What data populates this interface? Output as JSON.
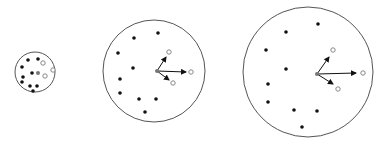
{
  "diagram": {
    "colors": {
      "background": "#ffffff",
      "circle_stroke": "#555555",
      "filled_point": "#111111",
      "center_point": "#777777",
      "hollow_point": "#888888",
      "arrow": "#111111"
    },
    "panels": [
      {
        "id": "small",
        "circle": {
          "cx": 35,
          "cy": 72,
          "r": 20
        },
        "filled_points": [
          [
            28,
            60
          ],
          [
            38,
            59
          ],
          [
            22,
            67
          ],
          [
            32,
            73
          ],
          [
            23,
            77
          ],
          [
            22,
            82
          ],
          [
            30,
            86
          ],
          [
            37,
            86
          ],
          [
            33,
            91
          ]
        ],
        "center_point": [
          38,
          73
        ],
        "hollow_points": [
          [
            43,
            63
          ],
          [
            45,
            76
          ],
          [
            53,
            70
          ]
        ],
        "arrows": []
      },
      {
        "id": "medium",
        "circle": {
          "cx": 154,
          "cy": 71,
          "r": 51
        },
        "filled_points": [
          [
            134,
            38
          ],
          [
            158,
            33
          ],
          [
            118,
            53
          ],
          [
            133,
            68
          ],
          [
            120,
            79
          ],
          [
            120,
            93
          ],
          [
            139,
            99
          ],
          [
            156,
            99
          ],
          [
            145,
            112
          ]
        ],
        "center_point": [
          157,
          71
        ],
        "hollow_points": [
          [
            169,
            52
          ],
          [
            191,
            72
          ],
          [
            173,
            83
          ]
        ],
        "arrows": [
          [
            157,
            71,
            166,
            57
          ],
          [
            157,
            71,
            186,
            72
          ],
          [
            157,
            71,
            169,
            80
          ]
        ]
      },
      {
        "id": "large",
        "circle": {
          "cx": 308,
          "cy": 72,
          "r": 65
        },
        "filled_points": [
          [
            286,
            32
          ],
          [
            318,
            24
          ],
          [
            266,
            50
          ],
          [
            286,
            69
          ],
          [
            268,
            84
          ],
          [
            268,
            102
          ],
          [
            294,
            110
          ],
          [
            317,
            111
          ],
          [
            302,
            127
          ]
        ],
        "center_point": [
          317,
          74
        ],
        "hollow_points": [
          [
            333,
            50
          ],
          [
            363,
            73
          ],
          [
            338,
            89
          ]
        ],
        "arrows": [
          [
            317,
            74,
            329,
            57
          ],
          [
            317,
            74,
            356,
            73
          ],
          [
            317,
            74,
            333,
            84
          ]
        ]
      }
    ]
  }
}
